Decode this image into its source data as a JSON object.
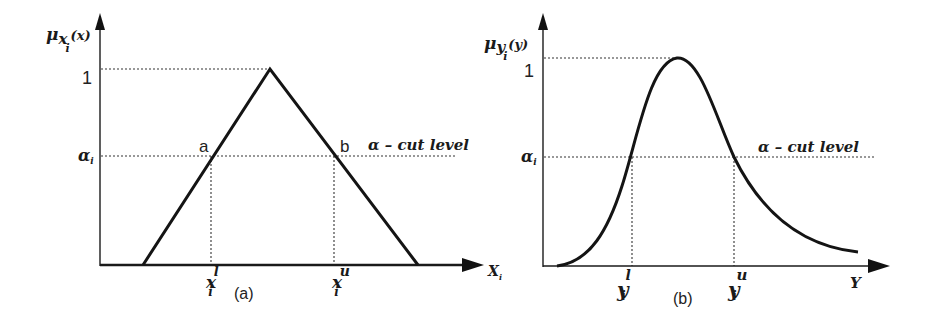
{
  "panels": [
    {
      "id": "a",
      "caption": "(a)",
      "shape": "triangular",
      "y_axis_label": {
        "main": "μ",
        "sub": "x",
        "subsub": "i",
        "arg": "(x)"
      },
      "x_axis_label": {
        "main": "X",
        "sub": "i"
      },
      "y_tick_one": "1",
      "alpha_label": {
        "main": "α",
        "sub": "i"
      },
      "cut_label": "α – cut level",
      "point_a": "a",
      "point_b": "b",
      "lower_label": {
        "main": "x",
        "sub": "i",
        "sup": "l"
      },
      "upper_label": {
        "main": "x",
        "sub": "i",
        "sup": "u"
      }
    },
    {
      "id": "b",
      "caption": "(b)",
      "shape": "bell-skewed",
      "y_axis_label": {
        "main": "μ",
        "sub": "y",
        "subsub": "i",
        "arg": "(y)"
      },
      "x_axis_label": {
        "main": "Y",
        "sub": ""
      },
      "y_tick_one": "1",
      "alpha_label": {
        "main": "α",
        "sub": "i"
      },
      "cut_label": "α – cut level",
      "lower_label": {
        "main": "y",
        "sub": "i",
        "sup": "l"
      },
      "upper_label": {
        "main": "y",
        "sub": "i",
        "sup": "u"
      }
    }
  ],
  "colors": {
    "ink": "#1a1a1a",
    "background": "#ffffff"
  }
}
